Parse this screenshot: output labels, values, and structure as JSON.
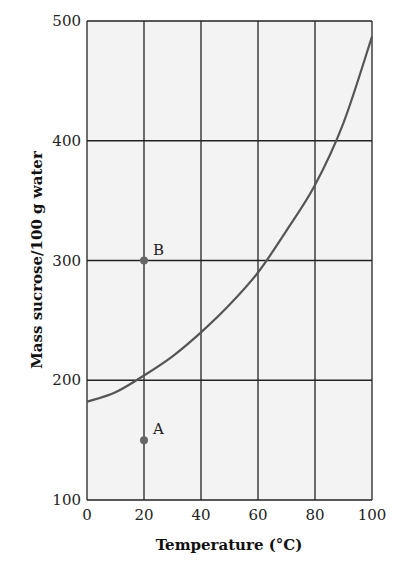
{
  "chart_data": {
    "type": "line",
    "title": "",
    "xlabel": "Temperature (°C)",
    "ylabel": "Mass sucrose/100 g water",
    "xlim": [
      0,
      100
    ],
    "ylim": [
      100,
      500
    ],
    "x_ticks": [
      0,
      20,
      40,
      60,
      80,
      100
    ],
    "y_ticks": [
      100,
      200,
      300,
      400,
      500
    ],
    "grid": true,
    "legend": null,
    "series": [
      {
        "name": "Solubility of sucrose",
        "x": [
          0,
          10,
          20,
          30,
          40,
          50,
          60,
          70,
          80,
          90,
          100
        ],
        "values": [
          182,
          190,
          204,
          220,
          240,
          263,
          290,
          325,
          363,
          415,
          487
        ],
        "color": "#555555"
      }
    ],
    "points": [
      {
        "label": "B",
        "x": 20,
        "y": 300
      },
      {
        "label": "A",
        "x": 20,
        "y": 150
      }
    ]
  },
  "colors": {
    "plot_background": "#f3f3f3",
    "grid": "#222222",
    "curve": "#555555",
    "point": "#666666"
  }
}
